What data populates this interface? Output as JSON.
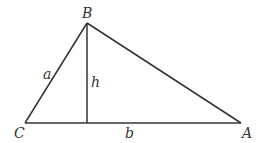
{
  "diagram": {
    "type": "triangle-with-altitude",
    "vertices": {
      "B": {
        "label": "B",
        "x": 87,
        "y": 23
      },
      "C": {
        "label": "C",
        "x": 25,
        "y": 123
      },
      "A": {
        "label": "A",
        "x": 241,
        "y": 123
      }
    },
    "altitude_foot": {
      "x": 87,
      "y": 123
    },
    "side_labels": {
      "a": "a",
      "b": "b",
      "h": "h"
    },
    "stroke_color": "#333333"
  }
}
